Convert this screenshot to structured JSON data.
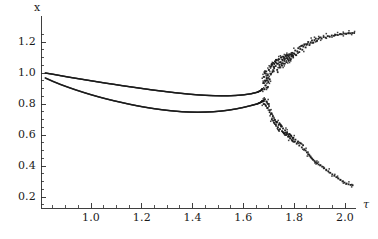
{
  "chart_data": {
    "type": "scatter",
    "title": "",
    "subtitle": "",
    "xlabel": "τ",
    "ylabel": "x",
    "xlim": [
      0.82,
      2.04
    ],
    "ylim": [
      0.0,
      1.33
    ],
    "xticks": [
      1.0,
      1.2,
      1.4,
      1.6,
      1.8,
      2.0
    ],
    "xticklabels": [
      "1.0",
      "1.2",
      "1.4",
      "1.6",
      "1.8",
      "2.0"
    ],
    "yticks": [
      0.2,
      0.4,
      0.6,
      0.8,
      1.0,
      1.2
    ],
    "yticklabels": [
      "0.2",
      "0.4",
      "0.6",
      "0.8",
      "1.0",
      "1.2"
    ],
    "grid": false,
    "legend": null,
    "legend_position": "none",
    "marker_color": "#1a1a1a",
    "marker_size": 1.6,
    "bifurcation_point": 1.68,
    "annotations": [],
    "series": [
      {
        "name": "upper-branch",
        "comment": "smooth upper branch from tau 0.82 to bifurcation",
        "points": [
          [
            0.82,
            1.0
          ],
          [
            0.85,
            0.992
          ],
          [
            0.88,
            0.983
          ],
          [
            0.91,
            0.974
          ],
          [
            0.94,
            0.966
          ],
          [
            0.97,
            0.958
          ],
          [
            1.0,
            0.95
          ],
          [
            1.03,
            0.942
          ],
          [
            1.06,
            0.934
          ],
          [
            1.09,
            0.927
          ],
          [
            1.12,
            0.919
          ],
          [
            1.15,
            0.912
          ],
          [
            1.18,
            0.905
          ],
          [
            1.21,
            0.898
          ],
          [
            1.24,
            0.891
          ],
          [
            1.27,
            0.885
          ],
          [
            1.3,
            0.879
          ],
          [
            1.33,
            0.873
          ],
          [
            1.36,
            0.868
          ],
          [
            1.39,
            0.863
          ],
          [
            1.42,
            0.859
          ],
          [
            1.45,
            0.856
          ],
          [
            1.48,
            0.854
          ],
          [
            1.51,
            0.853
          ],
          [
            1.54,
            0.853
          ],
          [
            1.57,
            0.855
          ],
          [
            1.6,
            0.859
          ],
          [
            1.63,
            0.866
          ],
          [
            1.655,
            0.876
          ],
          [
            1.67,
            0.888
          ],
          [
            1.675,
            0.898
          ]
        ]
      },
      {
        "name": "lower-branch",
        "comment": "smooth lower branch from tau 0.82 to bifurcation",
        "points": [
          [
            0.82,
            0.968
          ],
          [
            0.85,
            0.946
          ],
          [
            0.88,
            0.926
          ],
          [
            0.91,
            0.908
          ],
          [
            0.94,
            0.891
          ],
          [
            0.97,
            0.875
          ],
          [
            1.0,
            0.86
          ],
          [
            1.03,
            0.846
          ],
          [
            1.06,
            0.833
          ],
          [
            1.09,
            0.821
          ],
          [
            1.12,
            0.81
          ],
          [
            1.15,
            0.799
          ],
          [
            1.18,
            0.789
          ],
          [
            1.21,
            0.78
          ],
          [
            1.24,
            0.772
          ],
          [
            1.27,
            0.765
          ],
          [
            1.3,
            0.759
          ],
          [
            1.33,
            0.754
          ],
          [
            1.36,
            0.75
          ],
          [
            1.39,
            0.748
          ],
          [
            1.42,
            0.747
          ],
          [
            1.45,
            0.748
          ],
          [
            1.48,
            0.75
          ],
          [
            1.51,
            0.754
          ],
          [
            1.54,
            0.76
          ],
          [
            1.57,
            0.768
          ],
          [
            1.6,
            0.778
          ],
          [
            1.63,
            0.79
          ],
          [
            1.655,
            0.801
          ],
          [
            1.67,
            0.812
          ],
          [
            1.675,
            0.82
          ]
        ]
      },
      {
        "name": "chaotic-scatter-upper",
        "comment": "dense scatter band rising after bifurcation",
        "points": [
          [
            1.678,
            0.935
          ],
          [
            1.68,
            0.975
          ],
          [
            1.682,
            0.895
          ],
          [
            1.684,
            1.0
          ],
          [
            1.686,
            0.95
          ],
          [
            1.688,
            0.92
          ],
          [
            1.69,
            1.01
          ],
          [
            1.692,
            0.965
          ],
          [
            1.694,
            0.905
          ],
          [
            1.696,
            0.985
          ],
          [
            1.698,
            0.94
          ],
          [
            1.7,
            1.02
          ],
          [
            1.703,
            0.96
          ],
          [
            1.706,
            1.04
          ],
          [
            1.709,
            0.995
          ],
          [
            1.712,
            1.055
          ],
          [
            1.715,
            1.01
          ],
          [
            1.718,
            1.065
          ],
          [
            1.721,
            1.03
          ],
          [
            1.724,
            1.075
          ],
          [
            1.727,
            1.045
          ],
          [
            1.73,
            1.085
          ],
          [
            1.733,
            1.02
          ],
          [
            1.736,
            1.06
          ],
          [
            1.739,
            1.09
          ],
          [
            1.742,
            1.035
          ],
          [
            1.745,
            1.07
          ],
          [
            1.748,
            1.1
          ],
          [
            1.751,
            1.05
          ],
          [
            1.754,
            1.085
          ],
          [
            1.757,
            1.105
          ],
          [
            1.76,
            1.06
          ],
          [
            1.763,
            1.09
          ],
          [
            1.766,
            1.11
          ],
          [
            1.769,
            1.07
          ],
          [
            1.772,
            1.095
          ],
          [
            1.775,
            1.115
          ],
          [
            1.778,
            1.08
          ],
          [
            1.781,
            1.1
          ],
          [
            1.784,
            1.12
          ],
          [
            1.787,
            1.09
          ],
          [
            1.79,
            1.11
          ],
          [
            1.793,
            1.13
          ],
          [
            1.796,
            1.1
          ],
          [
            1.8,
            1.125
          ],
          [
            1.804,
            1.145
          ],
          [
            1.808,
            1.115
          ],
          [
            1.812,
            1.14
          ],
          [
            1.816,
            1.16
          ],
          [
            1.82,
            1.135
          ],
          [
            1.824,
            1.155
          ],
          [
            1.828,
            1.175
          ],
          [
            1.832,
            1.15
          ],
          [
            1.836,
            1.17
          ],
          [
            1.84,
            1.185
          ],
          [
            1.845,
            1.165
          ],
          [
            1.85,
            1.185
          ],
          [
            1.855,
            1.2
          ],
          [
            1.86,
            1.18
          ],
          [
            1.865,
            1.198
          ],
          [
            1.87,
            1.21
          ],
          [
            1.875,
            1.195
          ],
          [
            1.88,
            1.212
          ],
          [
            1.885,
            1.222
          ],
          [
            1.89,
            1.208
          ],
          [
            1.895,
            1.22
          ],
          [
            1.9,
            1.228
          ],
          [
            1.908,
            1.222
          ],
          [
            1.916,
            1.232
          ],
          [
            1.924,
            1.228
          ],
          [
            1.932,
            1.238
          ],
          [
            1.94,
            1.234
          ],
          [
            1.948,
            1.242
          ],
          [
            1.956,
            1.24
          ],
          [
            1.964,
            1.246
          ],
          [
            1.972,
            1.245
          ],
          [
            1.98,
            1.25
          ],
          [
            1.988,
            1.25
          ],
          [
            1.996,
            1.254
          ],
          [
            2.004,
            1.254
          ],
          [
            2.012,
            1.256
          ],
          [
            2.02,
            1.256
          ],
          [
            2.028,
            1.258
          ],
          [
            2.036,
            1.258
          ]
        ]
      },
      {
        "name": "chaotic-scatter-lower",
        "comment": "sparse scatter band descending after bifurcation",
        "points": [
          [
            1.678,
            0.82
          ],
          [
            1.68,
            0.8
          ],
          [
            1.684,
            0.83
          ],
          [
            1.688,
            0.79
          ],
          [
            1.692,
            0.815
          ],
          [
            1.696,
            0.775
          ],
          [
            1.7,
            0.8
          ],
          [
            1.704,
            0.76
          ],
          [
            1.708,
            0.735
          ],
          [
            1.712,
            0.7
          ],
          [
            1.716,
            0.72
          ],
          [
            1.72,
            0.68
          ],
          [
            1.724,
            0.698
          ],
          [
            1.728,
            0.665
          ],
          [
            1.732,
            0.685
          ],
          [
            1.736,
            0.65
          ],
          [
            1.74,
            0.668
          ],
          [
            1.744,
            0.638
          ],
          [
            1.748,
            0.655
          ],
          [
            1.752,
            0.625
          ],
          [
            1.756,
            0.642
          ],
          [
            1.76,
            0.612
          ],
          [
            1.764,
            0.63
          ],
          [
            1.768,
            0.6
          ],
          [
            1.772,
            0.618
          ],
          [
            1.776,
            0.59
          ],
          [
            1.78,
            0.606
          ],
          [
            1.784,
            0.578
          ],
          [
            1.788,
            0.594
          ],
          [
            1.792,
            0.566
          ],
          [
            1.796,
            0.582
          ],
          [
            1.8,
            0.556
          ],
          [
            1.805,
            0.57
          ],
          [
            1.81,
            0.544
          ],
          [
            1.815,
            0.558
          ],
          [
            1.82,
            0.532
          ],
          [
            1.825,
            0.546
          ],
          [
            1.83,
            0.52
          ],
          [
            1.835,
            0.534
          ],
          [
            1.84,
            0.508
          ],
          [
            1.845,
            0.5
          ],
          [
            1.85,
            0.488
          ],
          [
            1.855,
            0.476
          ],
          [
            1.86,
            0.466
          ],
          [
            1.865,
            0.456
          ],
          [
            1.87,
            0.448
          ],
          [
            1.875,
            0.44
          ],
          [
            1.88,
            0.432
          ],
          [
            1.885,
            0.424
          ],
          [
            1.89,
            0.418
          ],
          [
            1.896,
            0.41
          ],
          [
            1.902,
            0.404
          ],
          [
            1.91,
            0.396
          ],
          [
            1.918,
            0.386
          ],
          [
            1.926,
            0.376
          ],
          [
            1.934,
            0.366
          ],
          [
            1.942,
            0.356
          ],
          [
            1.95,
            0.346
          ],
          [
            1.958,
            0.337
          ],
          [
            1.966,
            0.328
          ],
          [
            1.974,
            0.319
          ],
          [
            1.982,
            0.31
          ],
          [
            1.99,
            0.301
          ],
          [
            1.998,
            0.293
          ],
          [
            2.006,
            0.287
          ],
          [
            2.014,
            0.282
          ],
          [
            2.022,
            0.278
          ],
          [
            2.03,
            0.276
          ]
        ]
      }
    ]
  },
  "axis": {
    "x_axis_name": "x",
    "tau_axis_name": "τ"
  }
}
